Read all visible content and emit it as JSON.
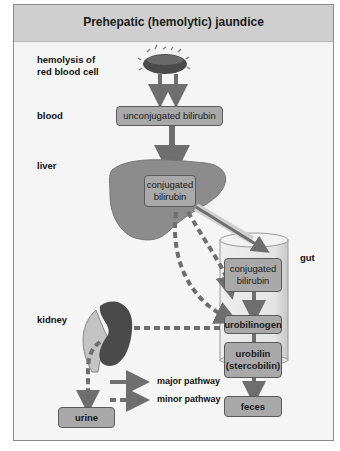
{
  "title": "Prehepatic (hemolytic) jaundice",
  "row_labels": {
    "hemolysis": "hemolysis of\nred blood cell",
    "blood": "blood",
    "liver": "liver",
    "gut": "gut",
    "kidney": "kidney"
  },
  "boxes": {
    "unconjugated": "unconjugated bilirubin",
    "conjugated_liver": "conjugated bilirubin",
    "conjugated_gut": "conjugated bilirubin",
    "urobilinogen": "urobilinogen",
    "urobilin": "urobilin (stercobilin)",
    "feces": "feces",
    "urine": "urine"
  },
  "legend": {
    "major": "major pathway",
    "minor": "minor pathway"
  },
  "colors": {
    "header": "#cfcfcf",
    "box": "#a9a9a9",
    "arrow": "#6e6e6e",
    "organ": "#8c8c8c",
    "kidney": "#4a4a4a"
  }
}
